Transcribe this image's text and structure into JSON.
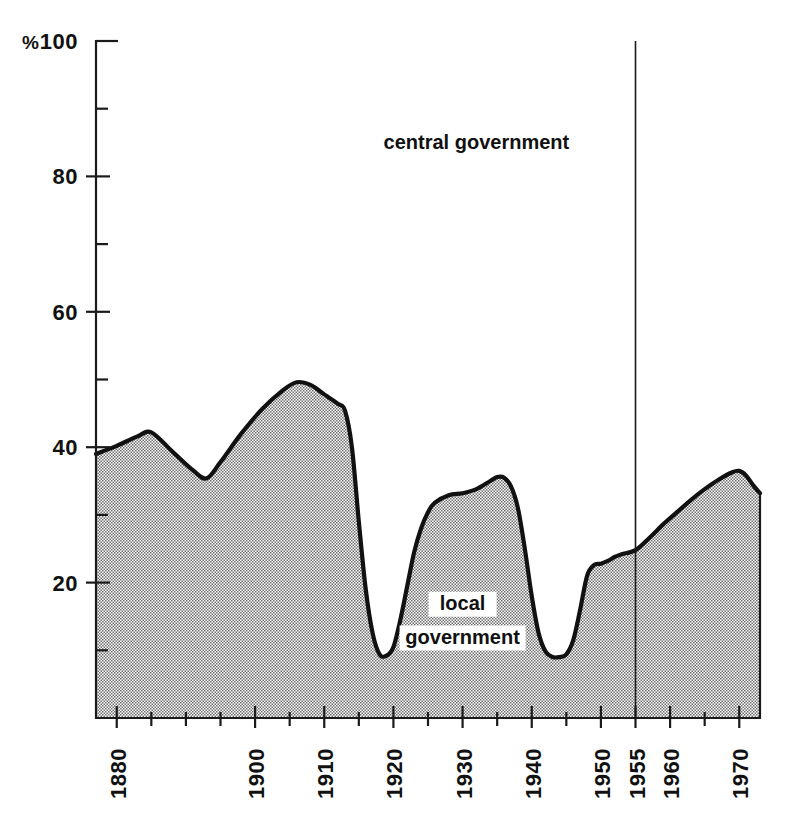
{
  "chart_data": {
    "type": "area",
    "title": "",
    "subtitle": "",
    "xlabel": "",
    "ylabel": "%",
    "unit_label": "%",
    "xlim": [
      1877,
      1973
    ],
    "ylim": [
      0,
      100
    ],
    "grid": false,
    "legend_position": "in-plot",
    "y_ticks_major": [
      0,
      20,
      40,
      60,
      80,
      100
    ],
    "y_tick_labels": [
      "",
      "20",
      "40",
      "60",
      "80",
      "100"
    ],
    "y_ticks_minor": [
      10,
      30,
      50,
      70,
      90
    ],
    "x_ticks_major": [
      1880,
      1900,
      1910,
      1920,
      1930,
      1940,
      1950,
      1955,
      1960,
      1970
    ],
    "x_tick_labels": [
      "1880",
      "1900",
      "1910",
      "1920",
      "1930",
      "1940",
      "1950",
      "1955",
      "1960",
      "1970"
    ],
    "x_ticks_minor": [
      1885,
      1890,
      1895,
      1905,
      1915,
      1925,
      1935,
      1945,
      1965
    ],
    "annotations": [
      {
        "text": "central government",
        "x": 1932,
        "y": 84,
        "boxed": false
      },
      {
        "text": "local",
        "x": 1930,
        "y": 16,
        "boxed": true
      },
      {
        "text": "government",
        "x": 1930,
        "y": 11,
        "boxed": true
      }
    ],
    "reference_lines": [
      {
        "x": 1955,
        "label": "1955",
        "from_y": 0,
        "to_y": 100
      }
    ],
    "series": [
      {
        "name": "local government",
        "fill": "#9a9a9a",
        "values": [
          [
            1877,
            39.0
          ],
          [
            1880,
            40.2
          ],
          [
            1883,
            41.6
          ],
          [
            1885,
            42.2
          ],
          [
            1888,
            39.4
          ],
          [
            1891,
            36.6
          ],
          [
            1893,
            35.4
          ],
          [
            1895,
            37.8
          ],
          [
            1898,
            42.0
          ],
          [
            1901,
            45.6
          ],
          [
            1904,
            48.4
          ],
          [
            1906,
            49.6
          ],
          [
            1908,
            49.2
          ],
          [
            1910,
            47.8
          ],
          [
            1912,
            46.4
          ],
          [
            1913,
            45.4
          ],
          [
            1914,
            40.0
          ],
          [
            1915,
            29.0
          ],
          [
            1916,
            19.0
          ],
          [
            1917,
            12.5
          ],
          [
            1918,
            9.4
          ],
          [
            1919,
            9.2
          ],
          [
            1920,
            10.5
          ],
          [
            1921,
            14.5
          ],
          [
            1922,
            19.5
          ],
          [
            1923,
            24.5
          ],
          [
            1924,
            28.0
          ],
          [
            1925,
            30.4
          ],
          [
            1926,
            31.8
          ],
          [
            1928,
            32.9
          ],
          [
            1930,
            33.2
          ],
          [
            1932,
            33.8
          ],
          [
            1934,
            35.0
          ],
          [
            1935,
            35.6
          ],
          [
            1936,
            35.5
          ],
          [
            1937,
            34.2
          ],
          [
            1938,
            31.0
          ],
          [
            1939,
            25.0
          ],
          [
            1940,
            18.0
          ],
          [
            1941,
            12.5
          ],
          [
            1942,
            9.8
          ],
          [
            1943,
            9.0
          ],
          [
            1944,
            9.0
          ],
          [
            1945,
            9.4
          ],
          [
            1946,
            11.5
          ],
          [
            1947,
            16.0
          ],
          [
            1948,
            21.0
          ],
          [
            1949,
            22.6
          ],
          [
            1950,
            22.8
          ],
          [
            1951,
            23.2
          ],
          [
            1952,
            23.8
          ],
          [
            1953,
            24.2
          ],
          [
            1955,
            24.8
          ],
          [
            1957,
            26.6
          ],
          [
            1959,
            28.6
          ],
          [
            1961,
            30.4
          ],
          [
            1963,
            32.2
          ],
          [
            1965,
            33.8
          ],
          [
            1967,
            35.2
          ],
          [
            1969,
            36.3
          ],
          [
            1970,
            36.5
          ],
          [
            1971,
            35.8
          ],
          [
            1972,
            34.4
          ],
          [
            1973,
            33.2
          ]
        ]
      }
    ]
  }
}
